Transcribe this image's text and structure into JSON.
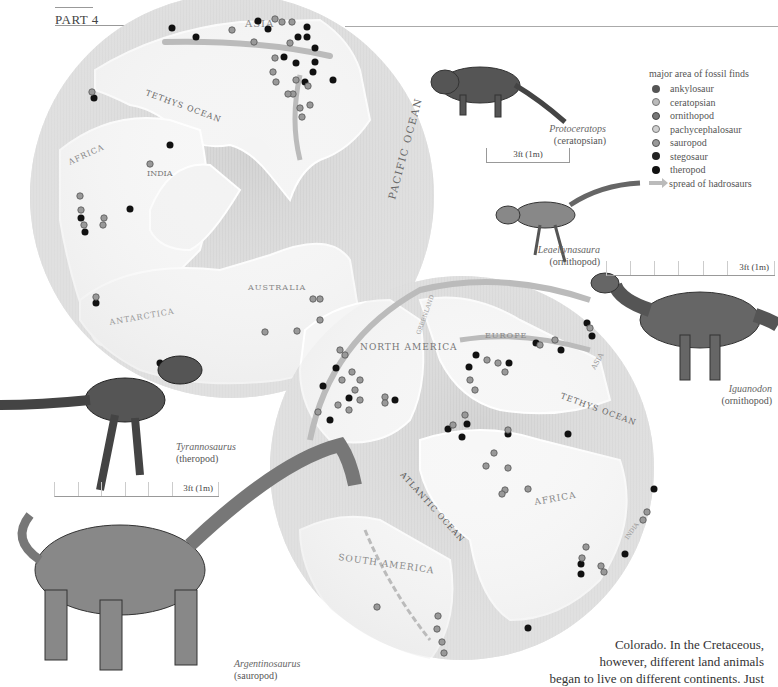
{
  "header": {
    "part_label": "PART 4"
  },
  "legend": {
    "title": "major area of fossil finds",
    "items": [
      {
        "label": "ankylosaur",
        "color": "#555555",
        "style": "solid"
      },
      {
        "label": "ceratopsian",
        "color": "#b0b0b0",
        "style": "patterned"
      },
      {
        "label": "ornithopod",
        "color": "#777777",
        "style": "patterned"
      },
      {
        "label": "pachycephalosaur",
        "color": "#cfcfcf",
        "style": "patterned"
      },
      {
        "label": "sauropod",
        "color": "#999999",
        "style": "patterned"
      },
      {
        "label": "stegosaur",
        "color": "#222222",
        "style": "solid"
      },
      {
        "label": "theropod",
        "color": "#111111",
        "style": "solid"
      }
    ],
    "arrow": {
      "label": "spread of hadrosaurs",
      "color": "#bbbbbb"
    }
  },
  "map_labels": {
    "globe1": [
      "ASIA",
      "TETHYS OCEAN",
      "AFRICA",
      "INDIA",
      "PACIFIC OCEAN",
      "AUSTRALIA",
      "ANTARCTICA"
    ],
    "globe2": [
      "NORTH AMERICA",
      "GREENLAND",
      "EUROPE",
      "ASIA",
      "TETHYS OCEAN",
      "ATLANTIC OCEAN",
      "AFRICA",
      "INDIA",
      "SOUTH AMERICA"
    ]
  },
  "dinosaurs": [
    {
      "name": "Protoceratops",
      "group": "(ceratopsian)",
      "scale": "3ft (1m)"
    },
    {
      "name": "Leaellynasaura",
      "group": "(ornithopod)"
    },
    {
      "name": "Iguanodon",
      "group": "(ornithopod)",
      "scale": "3ft (1m)"
    },
    {
      "name": "Tyrannosaurus",
      "group": "(theropod)",
      "scale": "3ft (1m)"
    },
    {
      "name": "Argentinosaurus",
      "group": "(sauropod)"
    }
  ],
  "body_text": {
    "lines": [
      "Colorado. In the Cretaceous,",
      "however, different land animals",
      "began to live on different continents. Just"
    ]
  }
}
